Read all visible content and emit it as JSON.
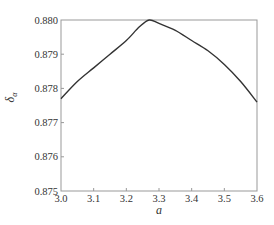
{
  "chart_data": {
    "type": "line",
    "title": "",
    "xlabel": "a",
    "ylabel": "δ_α",
    "ylabel_main": "δ",
    "ylabel_sub": "α",
    "xlim": [
      3.0,
      3.6
    ],
    "ylim": [
      0.875,
      0.88
    ],
    "grid": false,
    "legend": null,
    "x_ticks": [
      "3.0",
      "3.1",
      "3.2",
      "3.3",
      "3.4",
      "3.5",
      "3.6"
    ],
    "y_ticks": [
      "0.875",
      "0.876",
      "0.877",
      "0.878",
      "0.879",
      "0.880"
    ],
    "series": [
      {
        "name": "δ_α",
        "color": "#333333",
        "x": [
          3.0,
          3.05,
          3.1,
          3.15,
          3.2,
          3.24,
          3.27,
          3.3,
          3.35,
          3.4,
          3.45,
          3.5,
          3.55,
          3.6
        ],
        "y": [
          0.8777,
          0.8782,
          0.8786,
          0.879,
          0.8794,
          0.8798,
          0.88,
          0.8799,
          0.8797,
          0.8794,
          0.8791,
          0.8787,
          0.8782,
          0.8776
        ]
      }
    ]
  },
  "colors": {
    "axis": "#999999",
    "line": "#333333",
    "text": "#333333"
  }
}
